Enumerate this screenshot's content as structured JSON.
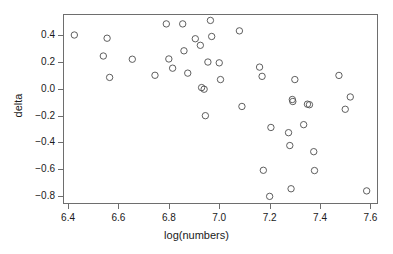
{
  "chart_data": {
    "type": "scatter",
    "title": "",
    "xlabel": "log(numbers)",
    "ylabel": "delta",
    "xlim": [
      6.38,
      7.63
    ],
    "ylim": [
      -0.86,
      0.56
    ],
    "grid": false,
    "legend": null,
    "xticks": [
      6.4,
      6.6,
      6.8,
      7.0,
      7.2,
      7.4,
      7.6
    ],
    "xticklabels": [
      "6.4",
      "6.6",
      "6.8",
      "7.0",
      "7.2",
      "7.4",
      "7.6"
    ],
    "yticks": [
      0.4,
      0.2,
      0.0,
      -0.2,
      -0.4,
      -0.6,
      -0.8
    ],
    "yticklabels": [
      "0.4",
      "0.2",
      "0.0",
      "-0.2",
      "-0.4",
      "-0.6",
      "-0.8"
    ],
    "marker": "open-circle",
    "marker_size": 3.2,
    "marker_color": "#4d4d4d",
    "frame_color": "#6e6e6e",
    "points": [
      {
        "x": 6.425,
        "y": 0.403
      },
      {
        "x": 6.54,
        "y": 0.246
      },
      {
        "x": 6.555,
        "y": 0.379
      },
      {
        "x": 6.565,
        "y": 0.086
      },
      {
        "x": 6.655,
        "y": 0.222
      },
      {
        "x": 6.745,
        "y": 0.102
      },
      {
        "x": 6.79,
        "y": 0.486
      },
      {
        "x": 6.8,
        "y": 0.224
      },
      {
        "x": 6.815,
        "y": 0.155
      },
      {
        "x": 6.855,
        "y": 0.486
      },
      {
        "x": 6.86,
        "y": 0.285
      },
      {
        "x": 6.875,
        "y": 0.118
      },
      {
        "x": 6.905,
        "y": 0.375
      },
      {
        "x": 6.925,
        "y": 0.326
      },
      {
        "x": 6.93,
        "y": 0.01
      },
      {
        "x": 6.94,
        "y": -0.002
      },
      {
        "x": 6.945,
        "y": -0.2
      },
      {
        "x": 6.955,
        "y": 0.201
      },
      {
        "x": 6.965,
        "y": 0.512
      },
      {
        "x": 6.97,
        "y": 0.392
      },
      {
        "x": 7.0,
        "y": 0.195
      },
      {
        "x": 7.005,
        "y": 0.07
      },
      {
        "x": 7.08,
        "y": 0.434
      },
      {
        "x": 7.09,
        "y": -0.131
      },
      {
        "x": 7.16,
        "y": 0.163
      },
      {
        "x": 7.17,
        "y": 0.094
      },
      {
        "x": 7.175,
        "y": -0.608
      },
      {
        "x": 7.2,
        "y": -0.803
      },
      {
        "x": 7.205,
        "y": -0.288
      },
      {
        "x": 7.275,
        "y": -0.327
      },
      {
        "x": 7.28,
        "y": -0.423
      },
      {
        "x": 7.285,
        "y": -0.746
      },
      {
        "x": 7.29,
        "y": -0.079
      },
      {
        "x": 7.292,
        "y": -0.094
      },
      {
        "x": 7.3,
        "y": 0.07
      },
      {
        "x": 7.335,
        "y": -0.267
      },
      {
        "x": 7.35,
        "y": -0.114
      },
      {
        "x": 7.358,
        "y": -0.118
      },
      {
        "x": 7.375,
        "y": -0.469
      },
      {
        "x": 7.378,
        "y": -0.61
      },
      {
        "x": 7.475,
        "y": 0.101
      },
      {
        "x": 7.5,
        "y": -0.152
      },
      {
        "x": 7.52,
        "y": -0.06
      },
      {
        "x": 7.585,
        "y": -0.762
      }
    ]
  }
}
